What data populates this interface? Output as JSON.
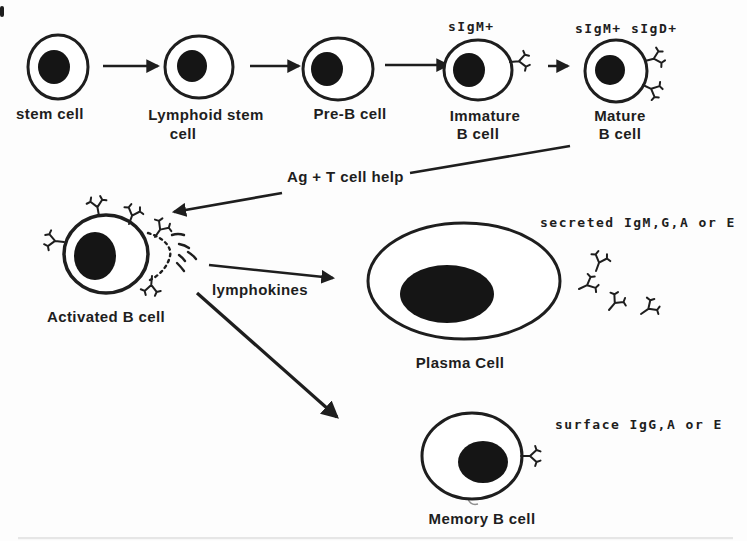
{
  "colors": {
    "ink": "#1e1e1e",
    "nucleus": "#151515",
    "background": "#fdfdfd"
  },
  "cells": {
    "stem": {
      "label": "stem cell"
    },
    "lymphoid": {
      "label_line1": "Lymphoid stem",
      "label_line2": "cell"
    },
    "pre_b": {
      "label": "Pre-B cell"
    },
    "immature": {
      "surface_marker": "sIgM+",
      "label_line1": "Immature",
      "label_line2": "B cell"
    },
    "mature": {
      "surface_marker": "sIgM+ sIgD+",
      "label_line1": "Mature",
      "label_line2": "B cell"
    },
    "activated": {
      "label": "Activated B cell"
    },
    "plasma": {
      "label": "Plasma Cell",
      "annotation": "secreted IgM,G,A or E"
    },
    "memory": {
      "label": "Memory B cell",
      "annotation": "surface IgG,A or E"
    }
  },
  "arrows": {
    "activation": {
      "label": "Ag + T cell help"
    },
    "differentiation": {
      "label": "lymphokines"
    }
  }
}
